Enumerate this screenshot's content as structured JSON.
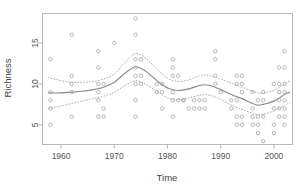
{
  "chart_data": {
    "type": "scatter",
    "title": "",
    "subtitle": "",
    "xlabel": "Time",
    "ylabel": "Richness",
    "xlim": [
      1956.5,
      2003.5
    ],
    "ylim": [
      2.6,
      18.6
    ],
    "grid": false,
    "legend": null,
    "xticks": [
      1960,
      1970,
      1980,
      1990,
      2000
    ],
    "xtick_labels": [
      "1960",
      "1970",
      "1980",
      "1990",
      "2000"
    ],
    "yticks": [
      5,
      10,
      15
    ],
    "ytick_labels": [
      "5",
      "10",
      "15"
    ],
    "point_marker": "open-circle",
    "point_color": "#a9a9a9",
    "fit_color": "#8a8a8a",
    "ci_color": "#a0a0a0",
    "series": [
      {
        "name": "observations",
        "marker": "open-circle",
        "points": [
          [
            1958,
            13
          ],
          [
            1958,
            9
          ],
          [
            1958,
            8
          ],
          [
            1958,
            7
          ],
          [
            1958,
            5
          ],
          [
            1962,
            16
          ],
          [
            1962,
            11
          ],
          [
            1962,
            10
          ],
          [
            1962,
            9
          ],
          [
            1962,
            6
          ],
          [
            1967,
            14
          ],
          [
            1967,
            12
          ],
          [
            1967,
            10
          ],
          [
            1967,
            9
          ],
          [
            1967,
            8
          ],
          [
            1967,
            6
          ],
          [
            1968,
            10
          ],
          [
            1968,
            7
          ],
          [
            1968,
            6
          ],
          [
            1970,
            15
          ],
          [
            1974,
            18
          ],
          [
            1974,
            16
          ],
          [
            1974,
            13
          ],
          [
            1974,
            12
          ],
          [
            1974,
            11
          ],
          [
            1974,
            10
          ],
          [
            1974,
            8
          ],
          [
            1974,
            6
          ],
          [
            1975,
            13
          ],
          [
            1975,
            11
          ],
          [
            1975,
            10
          ],
          [
            1978,
            10
          ],
          [
            1978,
            9
          ],
          [
            1979,
            10
          ],
          [
            1979,
            9
          ],
          [
            1979,
            7
          ],
          [
            1981,
            13
          ],
          [
            1981,
            12
          ],
          [
            1981,
            11
          ],
          [
            1981,
            9
          ],
          [
            1981,
            8
          ],
          [
            1981,
            6
          ],
          [
            1982,
            11
          ],
          [
            1982,
            8
          ],
          [
            1983,
            8
          ],
          [
            1983,
            8
          ],
          [
            1984,
            7
          ],
          [
            1985,
            8
          ],
          [
            1985,
            7
          ],
          [
            1986,
            8
          ],
          [
            1986,
            7
          ],
          [
            1987,
            8
          ],
          [
            1987,
            7
          ],
          [
            1989,
            14
          ],
          [
            1989,
            13
          ],
          [
            1989,
            11
          ],
          [
            1989,
            10
          ],
          [
            1990,
            9
          ],
          [
            1992,
            8
          ],
          [
            1992,
            7
          ],
          [
            1993,
            11
          ],
          [
            1993,
            10
          ],
          [
            1993,
            8
          ],
          [
            1993,
            6
          ],
          [
            1993,
            5
          ],
          [
            1994,
            11
          ],
          [
            1994,
            10
          ],
          [
            1994,
            9
          ],
          [
            1994,
            6
          ],
          [
            1994,
            5
          ],
          [
            1996,
            9
          ],
          [
            1996,
            7
          ],
          [
            1996,
            6
          ],
          [
            1996,
            5
          ],
          [
            1997,
            8
          ],
          [
            1997,
            6
          ],
          [
            1997,
            5
          ],
          [
            1997,
            4
          ],
          [
            1998,
            9
          ],
          [
            1998,
            8
          ],
          [
            1998,
            6
          ],
          [
            1998,
            3
          ],
          [
            2000,
            10
          ],
          [
            2000,
            7
          ],
          [
            2000,
            5
          ],
          [
            2000,
            4
          ],
          [
            2001,
            12
          ],
          [
            2001,
            10
          ],
          [
            2001,
            9
          ],
          [
            2001,
            8
          ],
          [
            2001,
            7
          ],
          [
            2001,
            6
          ],
          [
            2002,
            14
          ],
          [
            2002,
            12
          ],
          [
            2002,
            10
          ],
          [
            2002,
            9
          ],
          [
            2002,
            8
          ],
          [
            2002,
            7
          ],
          [
            2002,
            6
          ],
          [
            2002,
            5
          ]
        ]
      }
    ],
    "fit": {
      "name": "smoothed-fit",
      "style": "solid",
      "x": [
        1957.5,
        1960,
        1962,
        1964,
        1966,
        1968,
        1970,
        1972,
        1974,
        1976,
        1978,
        1980,
        1982,
        1984,
        1986,
        1987,
        1988,
        1990,
        1992,
        1994,
        1996,
        1997,
        1998,
        2000,
        2002,
        2003
      ],
      "y": [
        8.9,
        8.9,
        9.0,
        9.1,
        9.3,
        9.6,
        10.2,
        11.3,
        12.1,
        11.5,
        10.4,
        9.5,
        9.2,
        9.4,
        9.8,
        9.9,
        9.8,
        9.3,
        8.7,
        8.2,
        7.6,
        7.4,
        7.5,
        7.9,
        8.7,
        9.0
      ]
    },
    "ci_upper": {
      "name": "upper-confidence-band",
      "style": "dashed",
      "x": [
        1957.5,
        1960,
        1962,
        1964,
        1966,
        1968,
        1970,
        1972,
        1974,
        1976,
        1978,
        1980,
        1982,
        1984,
        1986,
        1987,
        1988,
        1990,
        1992,
        1994,
        1996,
        1997,
        1998,
        2000,
        2002,
        2003
      ],
      "y": [
        10.8,
        10.4,
        10.2,
        10.2,
        10.3,
        10.6,
        11.2,
        12.6,
        13.7,
        13.1,
        11.8,
        10.7,
        10.3,
        10.5,
        11.0,
        11.1,
        11.0,
        10.6,
        10.1,
        9.6,
        9.1,
        8.9,
        8.9,
        9.2,
        10.0,
        10.4
      ]
    },
    "ci_lower": {
      "name": "lower-confidence-band",
      "style": "dashed",
      "x": [
        1957.5,
        1960,
        1962,
        1964,
        1966,
        1968,
        1970,
        1972,
        1974,
        1976,
        1978,
        1980,
        1982,
        1984,
        1986,
        1987,
        1988,
        1990,
        1992,
        1994,
        1996,
        1997,
        1998,
        2000,
        2002,
        2003
      ],
      "y": [
        7.0,
        7.3,
        7.6,
        7.9,
        8.2,
        8.5,
        9.0,
        9.8,
        10.4,
        9.9,
        9.1,
        8.3,
        8.1,
        8.3,
        8.6,
        8.7,
        8.6,
        8.1,
        7.4,
        6.9,
        6.4,
        6.2,
        6.3,
        6.7,
        7.4,
        7.7
      ]
    }
  }
}
